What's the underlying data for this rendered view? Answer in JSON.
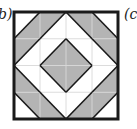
{
  "labels": {
    "left": "b)",
    "right": "(c"
  },
  "figure": {
    "grid": 4,
    "colors": {
      "shade": "#b4b4b4",
      "background": "#ffffff",
      "outline": "#1a1a1a",
      "gridline": "#d8d8d8"
    },
    "cells": [
      {
        "col": 0,
        "row": 0,
        "diag": "bl-tr",
        "shaded": "lower"
      },
      {
        "col": 1,
        "row": 0,
        "diag": "bl-tr",
        "shaded": "upper"
      },
      {
        "col": 2,
        "row": 0,
        "diag": "tl-br",
        "shaded": "upper"
      },
      {
        "col": 3,
        "row": 0,
        "diag": "tl-br",
        "shaded": "lower"
      },
      {
        "col": 0,
        "row": 1,
        "diag": "bl-tr",
        "shaded": "upper"
      },
      {
        "col": 1,
        "row": 1,
        "diag": "bl-tr",
        "shaded": "lower"
      },
      {
        "col": 2,
        "row": 1,
        "diag": "tl-br",
        "shaded": "lower"
      },
      {
        "col": 3,
        "row": 1,
        "diag": "tl-br",
        "shaded": "upper"
      },
      {
        "col": 0,
        "row": 2,
        "diag": "tl-br",
        "shaded": "lower"
      },
      {
        "col": 1,
        "row": 2,
        "diag": "tl-br",
        "shaded": "upper"
      },
      {
        "col": 2,
        "row": 2,
        "diag": "bl-tr",
        "shaded": "upper"
      },
      {
        "col": 3,
        "row": 2,
        "diag": "bl-tr",
        "shaded": "lower"
      },
      {
        "col": 0,
        "row": 3,
        "diag": "tl-br",
        "shaded": "upper"
      },
      {
        "col": 1,
        "row": 3,
        "diag": "tl-br",
        "shaded": "lower"
      },
      {
        "col": 2,
        "row": 3,
        "diag": "bl-tr",
        "shaded": "lower"
      },
      {
        "col": 3,
        "row": 3,
        "diag": "bl-tr",
        "shaded": "upper"
      }
    ]
  }
}
